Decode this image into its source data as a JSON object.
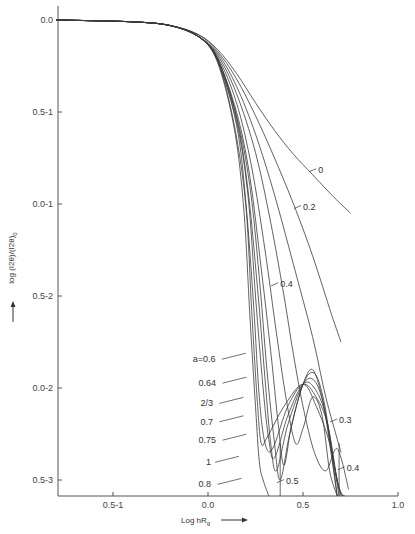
{
  "chart_data": {
    "type": "line",
    "title": "",
    "xlabel": "Log hR_g",
    "ylabel": "log (I2θ)/(I2θ)_0",
    "xlim": [
      -0.8,
      1.0
    ],
    "ylim": [
      -2.6,
      0.0
    ],
    "grid": false,
    "legend_position": "inline labels",
    "x_ticks": [
      {
        "value": -0.5,
        "label": "0.5-1"
      },
      {
        "value": 0.0,
        "label": "0.0"
      },
      {
        "value": 0.5,
        "label": "0.5"
      },
      {
        "value": 1.0,
        "label": "1.0"
      }
    ],
    "y_ticks": [
      {
        "value": 0.0,
        "label": "0.0"
      },
      {
        "value": -0.5,
        "label": "0.5-1"
      },
      {
        "value": -1.0,
        "label": "0.0-1"
      },
      {
        "value": -1.5,
        "label": "0.5-2"
      },
      {
        "value": -2.0,
        "label": "0.0-2"
      },
      {
        "value": -2.5,
        "label": "0.5-3"
      }
    ],
    "series": [
      {
        "name": "0",
        "points": [
          [
            -0.8,
            0
          ],
          [
            -0.4,
            -0.01
          ],
          [
            -0.2,
            -0.03
          ],
          [
            -0.05,
            -0.08
          ],
          [
            0.05,
            -0.16
          ],
          [
            0.15,
            -0.29
          ],
          [
            0.25,
            -0.45
          ],
          [
            0.35,
            -0.6
          ],
          [
            0.45,
            -0.73
          ],
          [
            0.55,
            -0.84
          ],
          [
            0.65,
            -0.95
          ],
          [
            0.75,
            -1.05
          ]
        ]
      },
      {
        "name": "0.2",
        "points": [
          [
            -0.8,
            0
          ],
          [
            -0.4,
            -0.01
          ],
          [
            -0.2,
            -0.03
          ],
          [
            -0.05,
            -0.08
          ],
          [
            0.05,
            -0.17
          ],
          [
            0.15,
            -0.32
          ],
          [
            0.25,
            -0.52
          ],
          [
            0.35,
            -0.75
          ],
          [
            0.45,
            -1.0
          ],
          [
            0.55,
            -1.28
          ],
          [
            0.65,
            -1.6
          ],
          [
            0.7,
            -1.75
          ]
        ]
      },
      {
        "name": "0.3",
        "points": [
          [
            -0.8,
            0
          ],
          [
            -0.4,
            -0.01
          ],
          [
            -0.2,
            -0.03
          ],
          [
            -0.05,
            -0.09
          ],
          [
            0.05,
            -0.18
          ],
          [
            0.15,
            -0.36
          ],
          [
            0.25,
            -0.62
          ],
          [
            0.35,
            -0.95
          ],
          [
            0.45,
            -1.33
          ],
          [
            0.55,
            -1.72
          ],
          [
            0.62,
            -2.05
          ],
          [
            0.7,
            -2.35
          ]
        ]
      },
      {
        "name": "0.4",
        "points": [
          [
            -0.8,
            0
          ],
          [
            -0.4,
            -0.01
          ],
          [
            -0.2,
            -0.03
          ],
          [
            -0.05,
            -0.09
          ],
          [
            0.05,
            -0.19
          ],
          [
            0.15,
            -0.4
          ],
          [
            0.25,
            -0.72
          ],
          [
            0.33,
            -1.1
          ],
          [
            0.4,
            -1.5
          ],
          [
            0.45,
            -1.82
          ],
          [
            0.5,
            -2.1
          ],
          [
            0.56,
            -2.35
          ],
          [
            0.62,
            -2.45
          ],
          [
            0.68,
            -2.33
          ],
          [
            0.74,
            -2.55
          ]
        ]
      },
      {
        "name": "0.5",
        "points": [
          [
            -0.8,
            0
          ],
          [
            -0.4,
            -0.01
          ],
          [
            -0.2,
            -0.03
          ],
          [
            -0.05,
            -0.09
          ],
          [
            0.05,
            -0.2
          ],
          [
            0.15,
            -0.45
          ],
          [
            0.23,
            -0.8
          ],
          [
            0.3,
            -1.25
          ],
          [
            0.36,
            -1.7
          ],
          [
            0.41,
            -2.05
          ],
          [
            0.46,
            -2.3
          ],
          [
            0.5,
            -2.22
          ],
          [
            0.55,
            -2.05
          ],
          [
            0.6,
            -2.15
          ],
          [
            0.64,
            -2.45
          ],
          [
            0.68,
            -2.62
          ]
        ]
      },
      {
        "name": "a=0.6",
        "points": [
          [
            -0.8,
            0
          ],
          [
            -0.4,
            -0.01
          ],
          [
            -0.2,
            -0.03
          ],
          [
            -0.05,
            -0.09
          ],
          [
            0.05,
            -0.21
          ],
          [
            0.15,
            -0.5
          ],
          [
            0.22,
            -0.85
          ],
          [
            0.28,
            -1.35
          ],
          [
            0.33,
            -1.8
          ],
          [
            0.37,
            -2.2
          ],
          [
            0.4,
            -2.42
          ],
          [
            0.44,
            -2.2
          ],
          [
            0.5,
            -1.98
          ],
          [
            0.55,
            -1.9
          ],
          [
            0.6,
            -2.05
          ],
          [
            0.64,
            -2.3
          ],
          [
            0.68,
            -2.6
          ]
        ]
      },
      {
        "name": "0.64",
        "points": [
          [
            -0.8,
            0
          ],
          [
            -0.4,
            -0.01
          ],
          [
            -0.2,
            -0.03
          ],
          [
            -0.05,
            -0.09
          ],
          [
            0.05,
            -0.21
          ],
          [
            0.15,
            -0.52
          ],
          [
            0.22,
            -0.9
          ],
          [
            0.27,
            -1.4
          ],
          [
            0.31,
            -1.9
          ],
          [
            0.35,
            -2.3
          ],
          [
            0.38,
            -2.5
          ],
          [
            0.43,
            -2.25
          ],
          [
            0.5,
            -1.98
          ],
          [
            0.56,
            -1.92
          ],
          [
            0.61,
            -2.07
          ],
          [
            0.65,
            -2.35
          ],
          [
            0.68,
            -2.6
          ]
        ]
      },
      {
        "name": "2/3",
        "points": [
          [
            -0.8,
            0
          ],
          [
            -0.4,
            -0.01
          ],
          [
            -0.2,
            -0.03
          ],
          [
            -0.05,
            -0.09
          ],
          [
            0.05,
            -0.21
          ],
          [
            0.15,
            -0.53
          ],
          [
            0.21,
            -0.92
          ],
          [
            0.26,
            -1.45
          ],
          [
            0.3,
            -1.95
          ],
          [
            0.33,
            -2.3
          ],
          [
            0.36,
            -2.45
          ],
          [
            0.42,
            -2.2
          ],
          [
            0.5,
            -1.98
          ],
          [
            0.56,
            -1.96
          ],
          [
            0.61,
            -2.1
          ],
          [
            0.66,
            -2.4
          ],
          [
            0.69,
            -2.6
          ]
        ]
      },
      {
        "name": "0.7",
        "points": [
          [
            -0.8,
            0
          ],
          [
            -0.4,
            -0.01
          ],
          [
            -0.2,
            -0.03
          ],
          [
            -0.05,
            -0.09
          ],
          [
            0.05,
            -0.22
          ],
          [
            0.15,
            -0.55
          ],
          [
            0.21,
            -0.95
          ],
          [
            0.25,
            -1.5
          ],
          [
            0.29,
            -2.0
          ],
          [
            0.32,
            -2.28
          ],
          [
            0.35,
            -2.38
          ],
          [
            0.42,
            -2.15
          ],
          [
            0.5,
            -1.98
          ],
          [
            0.56,
            -2.0
          ],
          [
            0.62,
            -2.15
          ],
          [
            0.67,
            -2.45
          ],
          [
            0.7,
            -2.6
          ]
        ]
      },
      {
        "name": "0.75",
        "points": [
          [
            -0.8,
            0
          ],
          [
            -0.4,
            -0.01
          ],
          [
            -0.2,
            -0.03
          ],
          [
            -0.05,
            -0.09
          ],
          [
            0.05,
            -0.22
          ],
          [
            0.15,
            -0.57
          ],
          [
            0.2,
            -1.0
          ],
          [
            0.24,
            -1.55
          ],
          [
            0.27,
            -2.05
          ],
          [
            0.3,
            -2.3
          ],
          [
            0.34,
            -2.33
          ],
          [
            0.42,
            -2.1
          ],
          [
            0.5,
            -1.98
          ],
          [
            0.57,
            -2.05
          ],
          [
            0.63,
            -2.2
          ],
          [
            0.68,
            -2.5
          ],
          [
            0.71,
            -2.6
          ]
        ]
      },
      {
        "name": "1",
        "points": [
          [
            -0.8,
            0
          ],
          [
            -0.4,
            -0.01
          ],
          [
            -0.2,
            -0.03
          ],
          [
            -0.05,
            -0.09
          ],
          [
            0.05,
            -0.23
          ],
          [
            0.14,
            -0.6
          ],
          [
            0.19,
            -1.05
          ],
          [
            0.22,
            -1.6
          ],
          [
            0.25,
            -2.1
          ],
          [
            0.27,
            -2.4
          ],
          [
            0.29,
            -2.5
          ],
          [
            0.32,
            -2.6
          ]
        ]
      },
      {
        "name": "0.8",
        "points": [
          [
            -0.8,
            0
          ],
          [
            -0.4,
            -0.01
          ],
          [
            -0.2,
            -0.03
          ],
          [
            -0.05,
            -0.09
          ],
          [
            0.05,
            -0.22
          ],
          [
            0.14,
            -0.58
          ],
          [
            0.2,
            -1.02
          ],
          [
            0.23,
            -1.58
          ],
          [
            0.26,
            -2.08
          ],
          [
            0.28,
            -2.3
          ],
          [
            0.31,
            -2.27
          ],
          [
            0.4,
            -2.1
          ],
          [
            0.5,
            -1.98
          ],
          [
            0.57,
            -2.1
          ],
          [
            0.64,
            -2.3
          ],
          [
            0.69,
            -2.55
          ],
          [
            0.72,
            -2.6
          ]
        ]
      }
    ],
    "vertical_lines": [
      0.38,
      0.69
    ],
    "annotations": [
      {
        "text": "0",
        "x": 0.58,
        "y": -0.83
      },
      {
        "text": "0.2",
        "x": 0.5,
        "y": -1.03
      },
      {
        "text": "0.4",
        "x": 0.38,
        "y": -1.45
      },
      {
        "text": "a=0.6",
        "x": -0.08,
        "y": -1.86
      },
      {
        "text": "0.64",
        "x": -0.05,
        "y": -1.99
      },
      {
        "text": "2/3",
        "x": -0.04,
        "y": -2.1
      },
      {
        "text": "0.7",
        "x": -0.04,
        "y": -2.2
      },
      {
        "text": "0.75",
        "x": -0.05,
        "y": -2.3
      },
      {
        "text": "1",
        "x": -0.01,
        "y": -2.42
      },
      {
        "text": "0.8",
        "x": -0.05,
        "y": -2.54
      },
      {
        "text": "0.3",
        "x": 0.69,
        "y": -2.19
      },
      {
        "text": "0.5",
        "x": 0.41,
        "y": -2.52
      },
      {
        "text": "0.4",
        "x": 0.73,
        "y": -2.45
      }
    ]
  },
  "axes": {
    "x_title": "Log hR",
    "x_title_sub": "g",
    "x_arrow": "→",
    "y_title": "log (I2θ)/(I2θ)",
    "y_title_sub": "0",
    "y_arrow": "→"
  }
}
